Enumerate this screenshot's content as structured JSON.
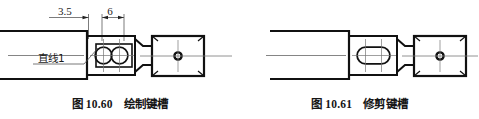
{
  "page": {
    "background": "#ffffff",
    "ink": "#111111",
    "thin_ink": "#555555"
  },
  "figures": [
    {
      "id": "figure-left",
      "caption_number": "图 10.60",
      "caption_text": "绘制键槽",
      "caption_full": "图 10.60  绘制键槽",
      "dimensions": [
        {
          "name": "dim-3-5",
          "value": "3.5"
        },
        {
          "name": "dim-6",
          "value": "6"
        }
      ],
      "annotations": [
        {
          "name": "note-line-1",
          "value": "直线1"
        }
      ],
      "keyway_state": "untrimmed-two-circles-and-rectangle"
    },
    {
      "id": "figure-right",
      "caption_number": "图 10.61",
      "caption_text": "修剪键槽",
      "caption_full": "图 10.61  修剪键槽",
      "dimensions": [],
      "annotations": [],
      "keyway_state": "trimmed-slot"
    }
  ]
}
